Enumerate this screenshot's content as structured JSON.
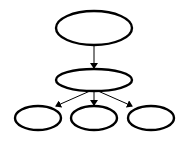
{
  "diagram": {
    "type": "tree",
    "background": "#ffffff",
    "stroke_color": "#000000",
    "nodes": [
      {
        "id": "root",
        "label": "",
        "cx": 94,
        "cy": 28,
        "rx": 38,
        "ry": 17
      },
      {
        "id": "mid",
        "label": "",
        "cx": 94,
        "cy": 80,
        "rx": 38,
        "ry": 11
      },
      {
        "id": "leaf-left",
        "label": "",
        "cx": 38,
        "cy": 118,
        "rx": 23,
        "ry": 12
      },
      {
        "id": "leaf-center",
        "label": "",
        "cx": 94,
        "cy": 118,
        "rx": 23,
        "ry": 12
      },
      {
        "id": "leaf-right",
        "label": "",
        "cx": 151,
        "cy": 118,
        "rx": 23,
        "ry": 12
      }
    ],
    "edges": [
      {
        "from": "root",
        "to": "mid"
      },
      {
        "from": "mid",
        "to": "leaf-left"
      },
      {
        "from": "mid",
        "to": "leaf-center"
      },
      {
        "from": "mid",
        "to": "leaf-right"
      }
    ]
  }
}
